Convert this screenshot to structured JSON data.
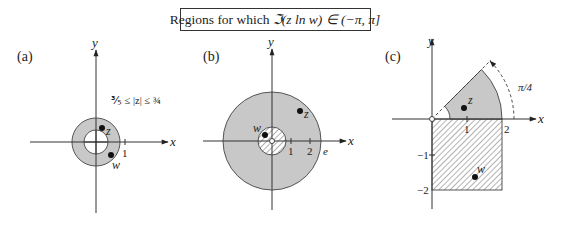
{
  "title": {
    "prefix": "Regions for which ",
    "expr": "ℑ(z ln w) ∈ (−π, π]"
  },
  "panels": {
    "a": {
      "label": "(a)",
      "x_axis": "x",
      "y_axis": "y",
      "tick_1": "1",
      "annotation": "⅗ ≤ |z| ≤ ¾",
      "annotation_parts": {
        "low": "3/8",
        "high": "3/4",
        "mid": "≤ |z| ≤"
      },
      "point_z": "z",
      "point_w": "w",
      "inner_radius": 0.375,
      "outer_radius": 0.75
    },
    "b": {
      "label": "(b)",
      "x_axis": "x",
      "y_axis": "y",
      "tick_1": "1",
      "tick_2": "2",
      "tick_e": "e",
      "point_z": "z",
      "point_w": "w"
    },
    "c": {
      "label": "(c)",
      "x_axis": "x",
      "y_axis": "y",
      "tick_1": "1",
      "tick_2": "2",
      "tick_m1": "−1",
      "tick_m2": "−2",
      "angle_label": "π/4",
      "point_z": "z",
      "point_w": "w"
    }
  }
}
